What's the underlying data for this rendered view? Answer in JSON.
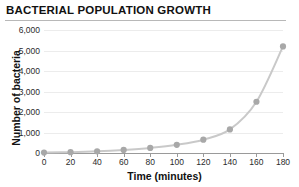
{
  "chart_data": {
    "type": "line",
    "title": "BACTERIAL POPULATION GROWTH",
    "xlabel": "Time (minutes)",
    "ylabel": "Number of bacteria",
    "x": [
      0,
      20,
      40,
      60,
      80,
      100,
      120,
      140,
      160,
      180
    ],
    "values": [
      20,
      40,
      80,
      150,
      250,
      400,
      650,
      1150,
      2500,
      5200
    ],
    "series": [
      {
        "name": "Bacteria count",
        "values": [
          20,
          40,
          80,
          150,
          250,
          400,
          650,
          1150,
          2500,
          5200
        ]
      }
    ],
    "xlim": [
      0,
      180
    ],
    "ylim": [
      0,
      6000
    ],
    "xticks": [
      "0",
      "20",
      "40",
      "60",
      "80",
      "100",
      "120",
      "140",
      "160",
      "180"
    ],
    "yticks": [
      "0",
      "1,000",
      "2,000",
      "3,000",
      "4,000",
      "5,000",
      "6,000"
    ],
    "ytick_values": [
      0,
      1000,
      2000,
      3000,
      4000,
      5000,
      6000
    ],
    "grid": true,
    "legend": false,
    "marker_color": "#a8a8a8",
    "line_color": "#c9c9c9",
    "grid_color": "#ececec",
    "axis_color": "#9a9a9a",
    "background": "#ffffff"
  }
}
